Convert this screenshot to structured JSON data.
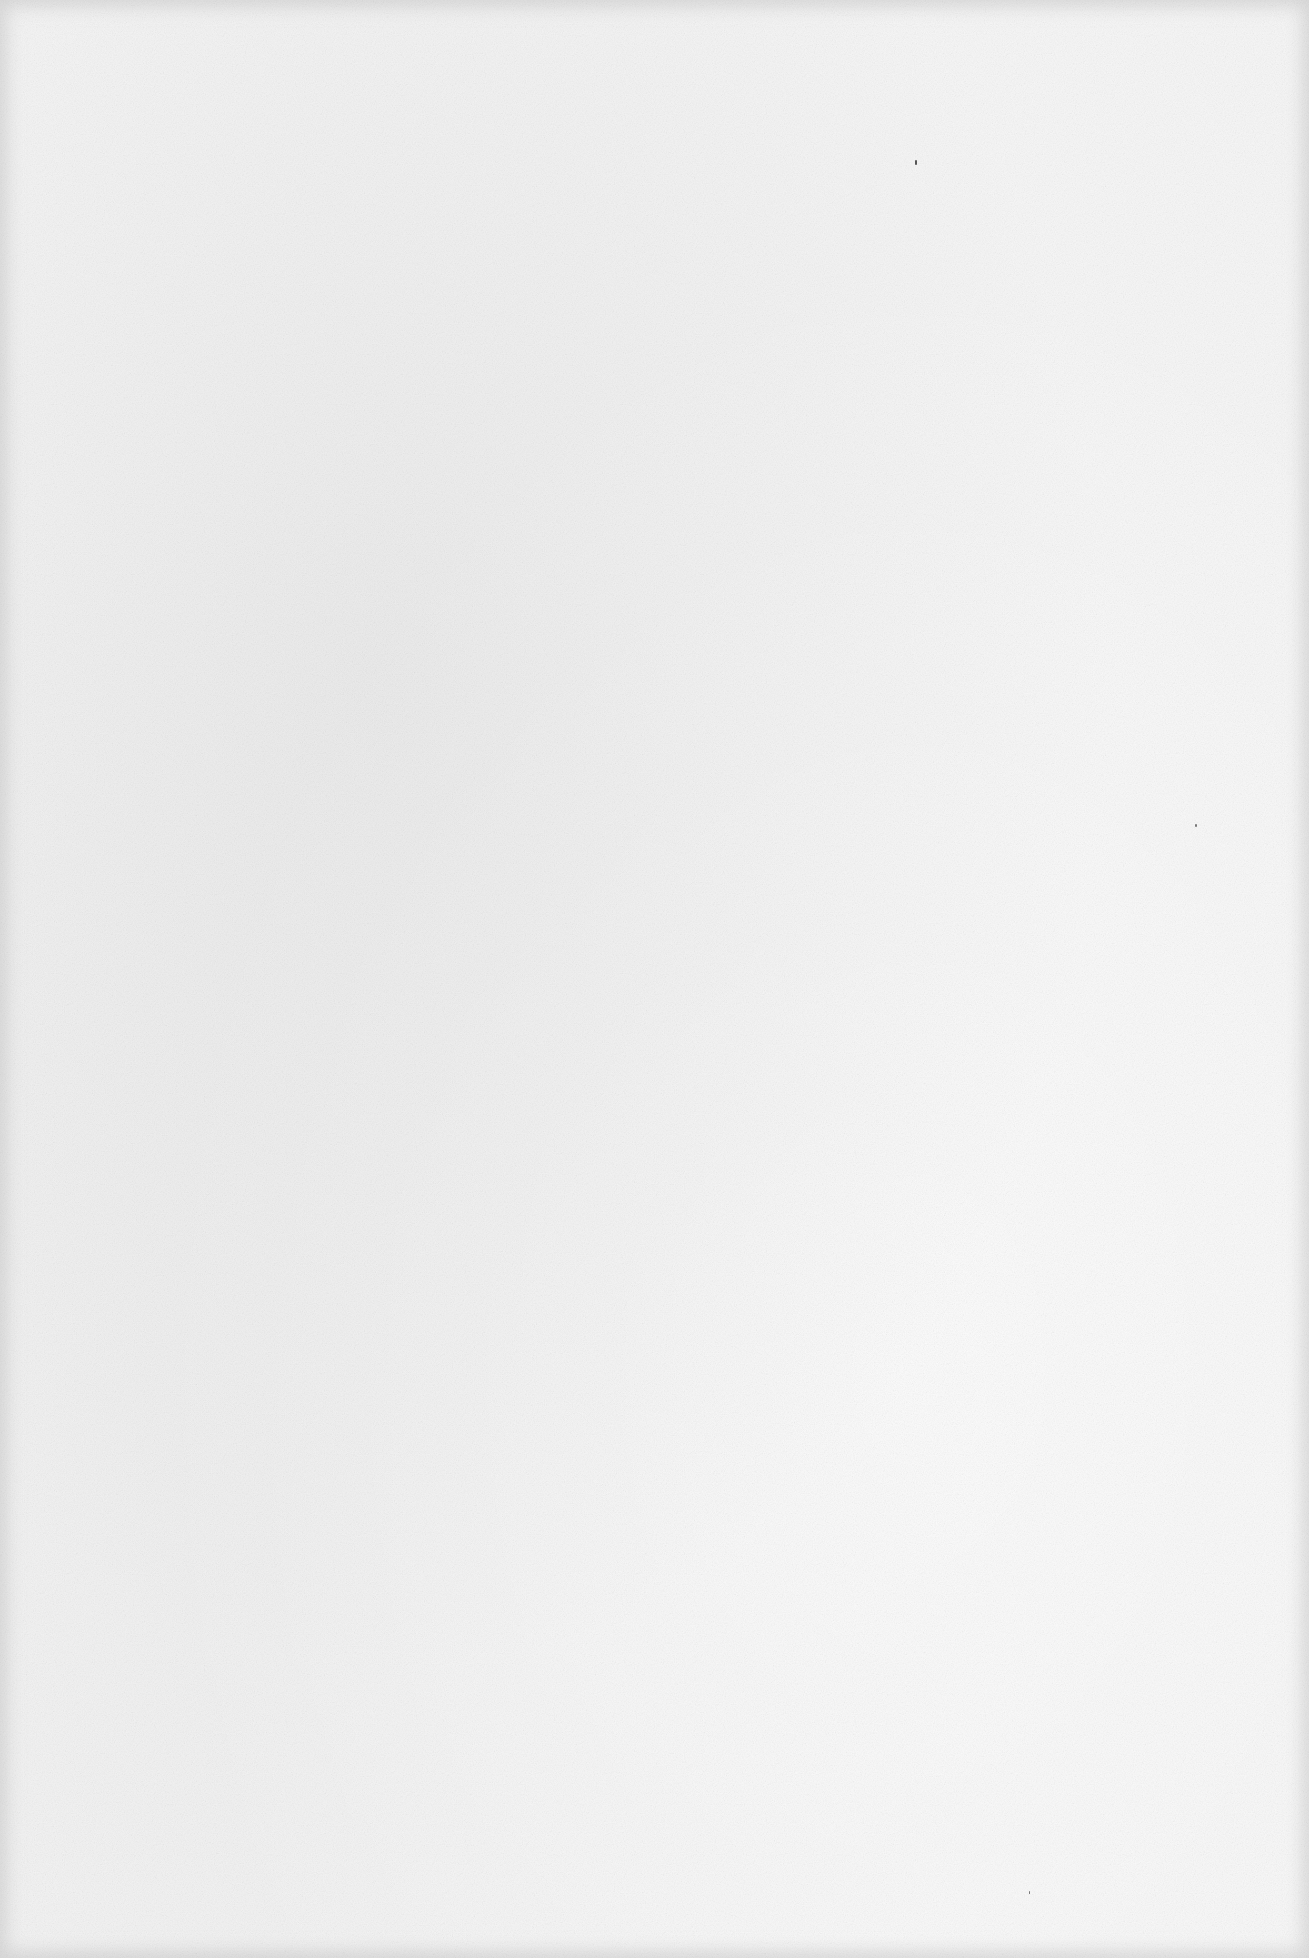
{
  "page": {
    "content": "",
    "background_color": "#f6f6f6",
    "edge_shadow_color": "#bebebe"
  }
}
